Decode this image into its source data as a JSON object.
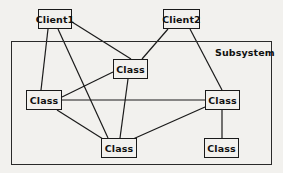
{
  "diagram": {
    "type": "uml-subsystem-collaboration-diagram",
    "canvas": {
      "width": 283,
      "height": 173,
      "background": "#f2f1ee"
    },
    "style": {
      "node_fill": "#f2f1ee",
      "node_stroke": "#1a1a1a",
      "edge_stroke": "#1a1a1a",
      "frame_stroke": "#2a2a2a"
    },
    "frame": {
      "label": "Subsystem",
      "x": 11,
      "y": 41,
      "width": 261,
      "height": 124,
      "label_x": 215,
      "label_y": 47
    },
    "nodes": [
      {
        "id": "client1",
        "label": "Client1",
        "x": 38,
        "y": 9,
        "width": 34,
        "height": 20,
        "inside_frame": false
      },
      {
        "id": "client2",
        "label": "Client2",
        "x": 163,
        "y": 9,
        "width": 37,
        "height": 20,
        "inside_frame": false
      },
      {
        "id": "class_top",
        "label": "Class",
        "x": 113,
        "y": 59,
        "width": 35,
        "height": 20,
        "inside_frame": true
      },
      {
        "id": "class_left",
        "label": "Class",
        "x": 26,
        "y": 90,
        "width": 36,
        "height": 20,
        "inside_frame": true
      },
      {
        "id": "class_right",
        "label": "Class",
        "x": 205,
        "y": 90,
        "width": 35,
        "height": 20,
        "inside_frame": true
      },
      {
        "id": "class_bottom",
        "label": "Class",
        "x": 101,
        "y": 138,
        "width": 36,
        "height": 20,
        "inside_frame": true
      },
      {
        "id": "class_br",
        "label": "Class",
        "x": 204,
        "y": 138,
        "width": 35,
        "height": 20,
        "inside_frame": true
      }
    ],
    "edges": [
      {
        "from": "client1",
        "to": "class_left",
        "x1": 48,
        "y1": 29,
        "x2": 41,
        "y2": 90
      },
      {
        "from": "client1",
        "to": "class_bottom",
        "x1": 58,
        "y1": 29,
        "x2": 108,
        "y2": 138
      },
      {
        "from": "client1",
        "to": "class_top",
        "x1": 72,
        "y1": 22,
        "x2": 131,
        "y2": 59
      },
      {
        "from": "client2",
        "to": "class_top",
        "x1": 168,
        "y1": 29,
        "x2": 142,
        "y2": 59
      },
      {
        "from": "client2",
        "to": "class_right",
        "x1": 190,
        "y1": 29,
        "x2": 222,
        "y2": 90
      },
      {
        "from": "class_top",
        "to": "class_left",
        "x1": 113,
        "y1": 72,
        "x2": 62,
        "y2": 97
      },
      {
        "from": "class_top",
        "to": "class_bottom",
        "x1": 128,
        "y1": 79,
        "x2": 120,
        "y2": 138
      },
      {
        "from": "class_left",
        "to": "class_right",
        "x1": 62,
        "y1": 100,
        "x2": 205,
        "y2": 100
      },
      {
        "from": "class_left",
        "to": "class_bottom",
        "x1": 57,
        "y1": 110,
        "x2": 103,
        "y2": 139
      },
      {
        "from": "class_right",
        "to": "class_bottom",
        "x1": 205,
        "y1": 107,
        "x2": 133,
        "y2": 139
      },
      {
        "from": "class_right",
        "to": "class_br",
        "x1": 222,
        "y1": 110,
        "x2": 222,
        "y2": 138
      }
    ]
  }
}
